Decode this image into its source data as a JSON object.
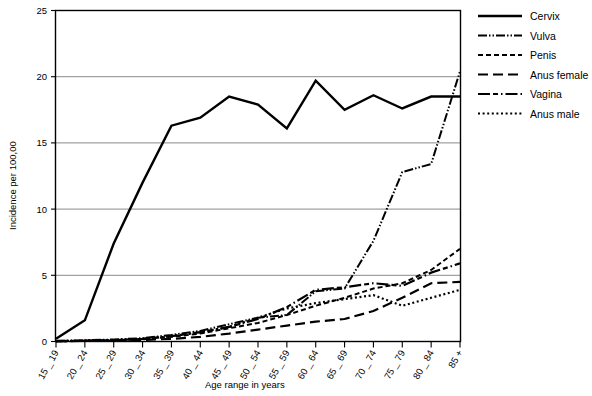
{
  "chart_data": {
    "type": "line",
    "title": "",
    "xlabel": "Age range in years",
    "ylabel": "Incidence per 100,00",
    "ylim": [
      0,
      25
    ],
    "yticks": [
      0,
      5,
      10,
      15,
      20,
      25
    ],
    "grid": true,
    "legend_position": "right",
    "categories": [
      "15 _ 19",
      "20 _ 24",
      "25 _ 29",
      "30 _ 34",
      "35 _ 39",
      "40 _ 44",
      "45 _ 49",
      "50 _ 54",
      "55 _ 59",
      "60 _ 64",
      "65 _ 69",
      "70 _ 74",
      "75 _ 79",
      "80 _ 84",
      "85 +"
    ],
    "series": [
      {
        "name": "Cervix",
        "style": "solid",
        "values": [
          0.2,
          1.6,
          7.4,
          12.0,
          16.3,
          16.9,
          18.5,
          17.9,
          16.1,
          19.7,
          17.5,
          18.6,
          17.6,
          18.5,
          18.5
        ]
      },
      {
        "name": "Vulva",
        "style": "dash-dot-dot",
        "values": [
          0.05,
          0.1,
          0.15,
          0.25,
          0.5,
          0.8,
          1.3,
          1.8,
          2.0,
          3.8,
          4.0,
          7.6,
          12.8,
          13.4,
          20.4
        ]
      },
      {
        "name": "Penis",
        "style": "short-dash",
        "values": [
          0.02,
          0.05,
          0.1,
          0.2,
          0.35,
          0.6,
          1.0,
          1.4,
          2.0,
          2.7,
          3.3,
          4.0,
          4.4,
          5.4,
          7.0
        ]
      },
      {
        "name": "Anus female",
        "style": "long-dash",
        "values": [
          0.02,
          0.04,
          0.08,
          0.12,
          0.2,
          0.35,
          0.6,
          0.9,
          1.2,
          1.5,
          1.7,
          2.3,
          3.3,
          4.4,
          4.5
        ]
      },
      {
        "name": "Vagina",
        "style": "solid-dash-dot",
        "values": [
          0.03,
          0.06,
          0.1,
          0.2,
          0.4,
          0.7,
          1.1,
          1.7,
          2.6,
          3.9,
          4.1,
          4.4,
          4.2,
          5.2,
          5.9
        ]
      },
      {
        "name": "Anus male",
        "style": "dotted",
        "values": [
          0.02,
          0.05,
          0.1,
          0.18,
          0.4,
          0.7,
          1.1,
          1.8,
          2.5,
          2.9,
          3.2,
          3.5,
          2.7,
          3.3,
          3.9
        ]
      }
    ]
  },
  "legend": {
    "items": [
      {
        "label": "Cervix"
      },
      {
        "label": "Vulva"
      },
      {
        "label": "Penis"
      },
      {
        "label": "Anus female"
      },
      {
        "label": "Vagina"
      },
      {
        "label": "Anus male"
      }
    ]
  },
  "colors": {
    "ink": "#000000",
    "grid": "#7d7d7d",
    "background": "#ffffff"
  }
}
